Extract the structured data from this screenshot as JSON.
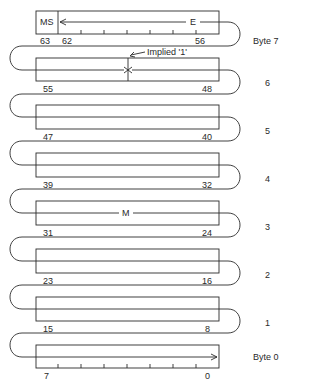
{
  "diagram": {
    "type": "memory-layout",
    "fields": {
      "sign": "MS",
      "exponent": "E",
      "mantissa": "M",
      "implied_bit": "Implied '1'"
    },
    "bytes": [
      {
        "label": "Byte 7",
        "high_bit": "63",
        "low_bit": "56",
        "extra_bit": "62"
      },
      {
        "label": "6",
        "high_bit": "55",
        "low_bit": "48"
      },
      {
        "label": "5",
        "high_bit": "47",
        "low_bit": "40"
      },
      {
        "label": "4",
        "high_bit": "39",
        "low_bit": "32"
      },
      {
        "label": "3",
        "high_bit": "31",
        "low_bit": "24"
      },
      {
        "label": "2",
        "high_bit": "23",
        "low_bit": "16"
      },
      {
        "label": "1",
        "high_bit": "15",
        "low_bit": "8"
      },
      {
        "label": "Byte 0",
        "high_bit": "7",
        "low_bit": "0"
      }
    ],
    "colors": {
      "line": "#2a2a2a",
      "background": "#ffffff"
    }
  }
}
